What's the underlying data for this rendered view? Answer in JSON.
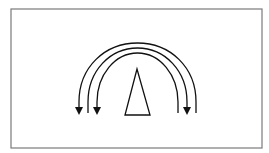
{
  "diagram": {
    "title": "",
    "colors": {
      "background": "#ffffff",
      "frame": "#7a7a7a",
      "stroke": "#111111"
    },
    "frame": {
      "x": 11,
      "y": 9,
      "width": 251,
      "height": 139
    },
    "triangle": {
      "apex": [
        137,
        69
      ],
      "base_left": [
        125,
        115
      ],
      "base_right": [
        150,
        115
      ]
    },
    "arcs": [
      {
        "name": "outer-arc",
        "left_end": [
          79,
          113
        ],
        "right_end": [
          196,
          113
        ],
        "top_y": 43,
        "arrow_at": "left"
      },
      {
        "name": "middle-arc",
        "left_end": [
          88,
          113
        ],
        "right_end": [
          187,
          113
        ],
        "top_y": 48,
        "arrow_at": "right"
      },
      {
        "name": "inner-arc",
        "left_end": [
          97,
          113
        ],
        "right_end": [
          178,
          113
        ],
        "top_y": 53,
        "arrow_at": "left"
      }
    ]
  }
}
